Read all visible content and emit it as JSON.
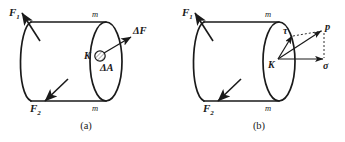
{
  "figure": {
    "kind": "mechanics-stress-diagram",
    "background_color": "#ffffff",
    "ink_color": "#1a1a1a",
    "panels": [
      {
        "id": "a",
        "caption": "(a)",
        "labels": {
          "force_top": "F",
          "force_top_sub": "1",
          "force_bottom": "F",
          "force_bottom_sub": "2",
          "section_top": "m",
          "section_bottom": "m",
          "point": "K",
          "delta_force": "ΔF",
          "delta_area": "ΔA"
        }
      },
      {
        "id": "b",
        "caption": "(b)",
        "labels": {
          "force_top": "F",
          "force_top_sub": "1",
          "force_bottom": "F",
          "force_bottom_sub": "2",
          "section_top": "m",
          "section_bottom": "m",
          "point": "K",
          "shear_stress": "τ",
          "total_stress": "p",
          "normal_stress": "σ"
        }
      }
    ]
  }
}
